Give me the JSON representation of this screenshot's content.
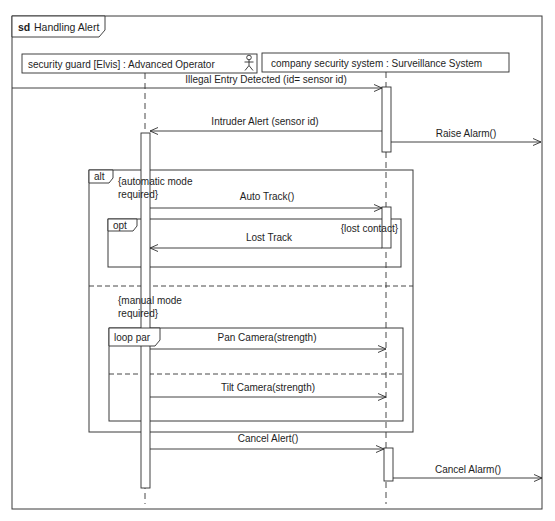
{
  "diagram": {
    "kind": "sd",
    "title": "Handling Alert"
  },
  "lifelines": [
    {
      "label": "security guard [Elvis] : Advanced Operator",
      "icon": "actor-icon"
    },
    {
      "label": "company security system : Surveillance System"
    }
  ],
  "messages": [
    {
      "label": "Illegal Entry Detected (id= sensor id)",
      "direction": "left-to-right"
    },
    {
      "label": "Intruder Alert (sensor id)",
      "direction": "right-to-left"
    },
    {
      "label": "Raise Alarm()",
      "direction": "left-to-right"
    },
    {
      "label": "Auto Track()",
      "direction": "left-to-right"
    },
    {
      "label": "Lost Track",
      "direction": "right-to-left"
    },
    {
      "label": "Pan Camera(strength)",
      "direction": "left-to-right"
    },
    {
      "label": "Tilt Camera(strength)",
      "direction": "left-to-right"
    },
    {
      "label": "Cancel Alert()",
      "direction": "left-to-right"
    },
    {
      "label": "Cancel Alarm()",
      "direction": "left-to-right"
    }
  ],
  "fragments": {
    "alt": {
      "operator": "alt",
      "operands": [
        {
          "guard": [
            "{automatic mode",
            "required}"
          ]
        },
        {
          "guard": [
            "{manual mode",
            "required}"
          ]
        }
      ]
    },
    "opt": {
      "operator": "opt",
      "guard": "{lost contact}"
    },
    "loop_par": {
      "operator": "loop par"
    }
  }
}
